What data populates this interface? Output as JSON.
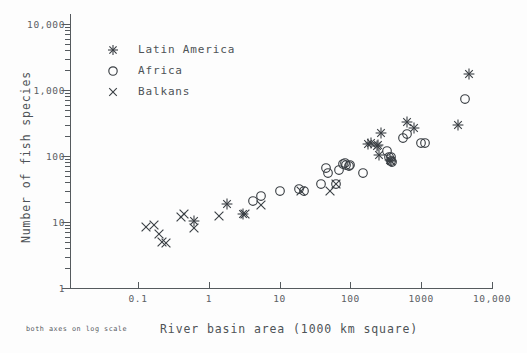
{
  "chart": {
    "type": "scatter",
    "title": "",
    "xlabel": "River basin area (1000 km square)",
    "ylabel": "Number of fish species",
    "note": "both axes on log scale",
    "xscale": "log",
    "yscale": "log",
    "xlim": [
      0.03,
      10000
    ],
    "ylim": [
      1,
      10000
    ],
    "grid": false,
    "legend_position": "upper-left",
    "xticklabels": [
      "0.1",
      "1",
      "10",
      "100",
      "1000",
      "10,000"
    ],
    "xtickvalues": [
      0.1,
      1,
      10,
      100,
      1000,
      10000
    ],
    "yticklabels": [
      "1",
      "10",
      "100",
      "1,000",
      "10,000"
    ],
    "ytickvalues": [
      1,
      10,
      100,
      1000,
      10000
    ]
  },
  "legend": {
    "items": [
      {
        "label": "Latin America",
        "marker": "asterisk-marker"
      },
      {
        "label": "Africa",
        "marker": "circle-marker"
      },
      {
        "label": "Balkans",
        "marker": "cross-marker"
      }
    ]
  },
  "chart_data": {
    "type": "scatter",
    "title": "",
    "xlabel": "River basin area (1000 km square)",
    "ylabel": "Number of fish species",
    "annotations": [
      "both axes on log scale"
    ],
    "xscale": "log",
    "yscale": "log",
    "xlim": [
      0.03,
      10000
    ],
    "ylim": [
      1,
      10000
    ],
    "grid": false,
    "legend_position": "upper-left",
    "series": [
      {
        "name": "Latin America",
        "marker": "asterisk",
        "points": [
          [
            0.62,
            10.5
          ],
          [
            1.8,
            19
          ],
          [
            3.0,
            13
          ],
          [
            180,
            150
          ],
          [
            195,
            155
          ],
          [
            235,
            140
          ],
          [
            245,
            145
          ],
          [
            250,
            105
          ],
          [
            270,
            220
          ],
          [
            360,
            86
          ],
          [
            380,
            84
          ],
          [
            620,
            330
          ],
          [
            780,
            270
          ],
          [
            3300,
            300
          ],
          [
            4800,
            1750
          ]
        ]
      },
      {
        "name": "Africa",
        "marker": "circle",
        "points": [
          [
            4.2,
            21
          ],
          [
            5.5,
            25
          ],
          [
            10,
            30
          ],
          [
            19,
            32
          ],
          [
            22,
            29
          ],
          [
            38,
            38
          ],
          [
            45,
            65
          ],
          [
            48,
            55
          ],
          [
            62,
            38
          ],
          [
            70,
            62
          ],
          [
            78,
            75
          ],
          [
            85,
            78
          ],
          [
            88,
            72
          ],
          [
            95,
            70
          ],
          [
            100,
            72
          ],
          [
            150,
            56
          ],
          [
            330,
            120
          ],
          [
            355,
            95
          ],
          [
            370,
            95
          ],
          [
            380,
            83
          ],
          [
            390,
            80
          ],
          [
            560,
            185
          ],
          [
            640,
            215
          ],
          [
            1000,
            160
          ],
          [
            1150,
            160
          ],
          [
            4200,
            720
          ]
        ]
      },
      {
        "name": "Balkans",
        "marker": "cross",
        "points": [
          [
            0.13,
            8.3
          ],
          [
            0.17,
            9.0
          ],
          [
            0.2,
            6.6
          ],
          [
            0.22,
            4.9
          ],
          [
            0.25,
            4.8
          ],
          [
            0.4,
            12
          ],
          [
            0.45,
            13
          ],
          [
            0.62,
            8.0
          ],
          [
            1.4,
            12.5
          ],
          [
            3.2,
            13
          ],
          [
            5.5,
            18
          ],
          [
            20,
            30
          ],
          [
            52,
            30
          ],
          [
            62,
            38
          ]
        ]
      }
    ]
  }
}
